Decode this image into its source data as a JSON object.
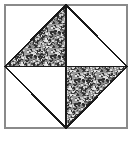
{
  "figure": {
    "kind": "geometric-diagram",
    "canvas": {
      "width": 137,
      "height": 143
    },
    "background_color": "#ffffff",
    "outer_square": {
      "name": "outer-square",
      "left": 5,
      "top": 5,
      "right": 127,
      "bottom": 128,
      "stroke_color": "#8a8a8a",
      "stroke_width": 1.4,
      "fill_color": "#ffffff"
    },
    "center_point": {
      "x": 66,
      "y": 66.5
    },
    "diamond": {
      "name": "inscribed-diamond",
      "stroke_color": "#1a1a1a",
      "stroke_width": 1.8,
      "fill_color": "none",
      "vertices": [
        {
          "label": "top",
          "x": 66,
          "y": 5
        },
        {
          "label": "right",
          "x": 127,
          "y": 66.5
        },
        {
          "label": "bottom",
          "x": 66,
          "y": 128
        },
        {
          "label": "left",
          "x": 5,
          "y": 66.5
        }
      ]
    },
    "cross_lines": [
      {
        "name": "horizontal-center-line",
        "x1": 5,
        "y1": 66.5,
        "x2": 127,
        "y2": 66.5,
        "stroke_color": "#1a1a1a",
        "stroke_width": 1.8
      },
      {
        "name": "vertical-center-line",
        "x1": 66,
        "y1": 5,
        "x2": 66,
        "y2": 128,
        "stroke_color": "#1a1a1a",
        "stroke_width": 1.8
      }
    ],
    "regions": [
      {
        "name": "diamond-triangle-top-left",
        "shaded": true,
        "points": "5,66.5 66,5 66,66.5"
      },
      {
        "name": "diamond-triangle-top-right",
        "shaded": false,
        "points": "66,5 127,66.5 66,66.5"
      },
      {
        "name": "diamond-triangle-bottom-left",
        "shaded": false,
        "points": "5,66.5 66,66.5 66,128"
      },
      {
        "name": "diamond-triangle-bottom-right",
        "shaded": true,
        "points": "66,66.5 127,66.5 66,128"
      },
      {
        "name": "corner-triangle-top-left",
        "shaded": false,
        "points": "5,5 66,5 5,66.5"
      },
      {
        "name": "corner-triangle-top-right",
        "shaded": false,
        "points": "66,5 127,5 127,66.5"
      },
      {
        "name": "corner-triangle-bottom-right",
        "shaded": false,
        "points": "127,66.5 127,128 66,128"
      },
      {
        "name": "corner-triangle-bottom-left",
        "shaded": false,
        "points": "5,66.5 66,128 5,128"
      }
    ],
    "shading": {
      "style": "random-gray-speckle",
      "base_color": "#9a9a9a",
      "speckle_dark": "#2b2b2b",
      "speckle_light": "#e8e8e8",
      "mean_gray": "#8c8c8c"
    }
  }
}
